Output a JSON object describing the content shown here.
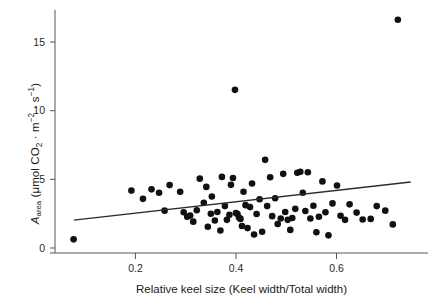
{
  "chart_data": {
    "type": "scatter",
    "title": "",
    "xlabel": "Relative keel size (Keel width/Total width)",
    "ylabel_plain": "A_area (umol CO2 . m-2 . s-1)",
    "ylabel_parts": {
      "symbol": "A",
      "symbol_sub": "area",
      "open": " (μmol CO",
      "co2_sub": "2",
      "mid": " · m",
      "m_sup": "−2",
      "mid2": " · s",
      "s_sup": "−1",
      "close": ")"
    },
    "xlim": [
      0.04,
      0.782
    ],
    "ylim": [
      -0.45,
      17.6
    ],
    "xticks": [
      0.2,
      0.4,
      0.6
    ],
    "xtick_labels": [
      "0.2",
      "0.4",
      "0.6"
    ],
    "yticks": [
      0,
      5,
      10,
      15
    ],
    "ytick_labels": [
      "0",
      "5",
      "10",
      "15"
    ],
    "grid": false,
    "legend": null,
    "marker": {
      "shape": "circle",
      "color": "#111111",
      "size": 4.6
    },
    "trendline": {
      "type": "linear",
      "color": "#2b2b2b",
      "width": 1.5,
      "x_start": 0.0775,
      "y_start": 2.03,
      "x_end": 0.7475,
      "y_end": 4.8
    },
    "points": [
      [
        0.077,
        0.63
      ],
      [
        0.192,
        4.18
      ],
      [
        0.215,
        3.58
      ],
      [
        0.232,
        4.27
      ],
      [
        0.247,
        4.02
      ],
      [
        0.258,
        2.72
      ],
      [
        0.268,
        4.58
      ],
      [
        0.289,
        4.1
      ],
      [
        0.296,
        2.6
      ],
      [
        0.303,
        2.28
      ],
      [
        0.309,
        2.36
      ],
      [
        0.315,
        1.92
      ],
      [
        0.322,
        2.75
      ],
      [
        0.328,
        5.05
      ],
      [
        0.336,
        3.3
      ],
      [
        0.341,
        4.45
      ],
      [
        0.344,
        1.55
      ],
      [
        0.35,
        2.5
      ],
      [
        0.352,
        3.75
      ],
      [
        0.358,
        2.0
      ],
      [
        0.363,
        2.62
      ],
      [
        0.369,
        1.28
      ],
      [
        0.372,
        5.18
      ],
      [
        0.378,
        3.05
      ],
      [
        0.382,
        2.05
      ],
      [
        0.387,
        2.42
      ],
      [
        0.39,
        4.6
      ],
      [
        0.394,
        5.1
      ],
      [
        0.398,
        11.52
      ],
      [
        0.4,
        2.55
      ],
      [
        0.403,
        2.48
      ],
      [
        0.406,
        2.22
      ],
      [
        0.409,
        2.12
      ],
      [
        0.412,
        1.6
      ],
      [
        0.415,
        4.1
      ],
      [
        0.419,
        3.12
      ],
      [
        0.423,
        1.45
      ],
      [
        0.428,
        2.98
      ],
      [
        0.432,
        4.7
      ],
      [
        0.436,
        0.98
      ],
      [
        0.441,
        2.48
      ],
      [
        0.447,
        3.55
      ],
      [
        0.452,
        1.18
      ],
      [
        0.458,
        6.42
      ],
      [
        0.462,
        3.05
      ],
      [
        0.468,
        5.15
      ],
      [
        0.472,
        2.32
      ],
      [
        0.478,
        3.62
      ],
      [
        0.483,
        1.75
      ],
      [
        0.489,
        2.15
      ],
      [
        0.494,
        5.4
      ],
      [
        0.498,
        2.62
      ],
      [
        0.503,
        2.05
      ],
      [
        0.508,
        1.32
      ],
      [
        0.512,
        2.18
      ],
      [
        0.518,
        2.85
      ],
      [
        0.522,
        5.48
      ],
      [
        0.528,
        5.55
      ],
      [
        0.533,
        4.02
      ],
      [
        0.538,
        2.7
      ],
      [
        0.543,
        5.52
      ],
      [
        0.548,
        2.15
      ],
      [
        0.554,
        3.08
      ],
      [
        0.56,
        1.15
      ],
      [
        0.565,
        2.28
      ],
      [
        0.572,
        4.85
      ],
      [
        0.578,
        2.6
      ],
      [
        0.584,
        0.92
      ],
      [
        0.592,
        3.25
      ],
      [
        0.601,
        4.55
      ],
      [
        0.608,
        2.35
      ],
      [
        0.617,
        2.05
      ],
      [
        0.626,
        3.18
      ],
      [
        0.64,
        2.58
      ],
      [
        0.652,
        2.08
      ],
      [
        0.668,
        2.12
      ],
      [
        0.68,
        3.05
      ],
      [
        0.697,
        2.72
      ],
      [
        0.712,
        1.72
      ],
      [
        0.722,
        16.62
      ]
    ]
  }
}
